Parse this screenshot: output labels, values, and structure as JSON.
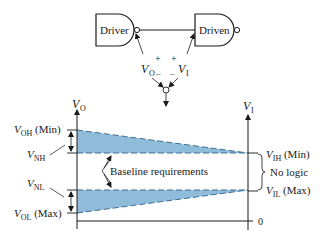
{
  "circuit": {
    "driver_label": "Driver",
    "driven_label": "Driven",
    "vo_symbol": "V",
    "vo_sub": "O",
    "vi_symbol": "V",
    "vi_sub": "I",
    "plus": "+",
    "minus": "–"
  },
  "chart": {
    "left_axis": {
      "symbol": "V",
      "sub": "O"
    },
    "right_axis": {
      "symbol": "V",
      "sub": "I"
    },
    "zero_label": "0",
    "left_labels": {
      "voh": {
        "symbol": "V",
        "sub": "OH",
        "suffix": " (Min)"
      },
      "vnh": {
        "symbol": "V",
        "sub": "NH"
      },
      "vnl": {
        "symbol": "V",
        "sub": "NL"
      },
      "vol": {
        "symbol": "V",
        "sub": "OL",
        "suffix": " (Max)"
      }
    },
    "right_labels": {
      "vih": {
        "symbol": "V",
        "sub": "IH",
        "suffix": " (Min)"
      },
      "no_logic": "No logic",
      "vil": {
        "symbol": "V",
        "sub": "IL",
        "suffix": " (Max)"
      }
    },
    "baseline_annotation": "Baseline requirements",
    "band_color": "#8fbcd8",
    "dash_color": "#3a6f96"
  }
}
